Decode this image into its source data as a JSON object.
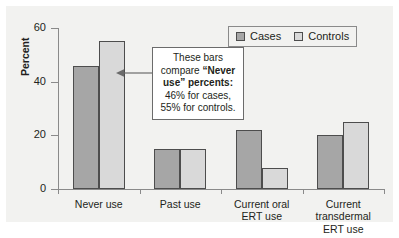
{
  "chart_data": {
    "type": "bar",
    "title": "",
    "xlabel": "",
    "ylabel": "Percent",
    "ylim": [
      0,
      60
    ],
    "yticks": [
      0,
      20,
      40,
      60
    ],
    "grid": false,
    "legend_position": "top-right",
    "categories": [
      "Never use",
      "Past use",
      "Current oral ERT use",
      "Current transdermal ERT use"
    ],
    "category_lines": [
      [
        "Never use"
      ],
      [
        "Past use"
      ],
      [
        "Current oral",
        "ERT use"
      ],
      [
        "Current",
        "transdermal",
        "ERT use"
      ]
    ],
    "series": [
      {
        "name": "Cases",
        "color": "#a6a6a6",
        "values": [
          46,
          15,
          22,
          20
        ]
      },
      {
        "name": "Controls",
        "color": "#d9d9d9",
        "values": [
          55,
          15,
          8,
          25
        ]
      }
    ],
    "annotations": [
      {
        "name": "never-use-callout",
        "text_parts": [
          {
            "text": "These bars compare ",
            "bold": false
          },
          {
            "text": "“Never use” percents:",
            "bold": true
          },
          {
            "text": " 46% for cases, 55% for controls.",
            "bold": false
          }
        ],
        "plain_text": "These bars compare “Never use” percents: 46% for cases, 55% for controls.",
        "points_to": "Never use controls bar"
      }
    ]
  },
  "legend": {
    "entries": [
      {
        "label": "Cases"
      },
      {
        "label": "Controls"
      }
    ]
  },
  "axis": {
    "y_title": "Percent",
    "y_tick_labels": [
      "60",
      "40",
      "20",
      "0"
    ]
  },
  "colors": {
    "cases": "#a6a6a6",
    "controls": "#d9d9d9",
    "bar_outline": "#4d4d4d",
    "axis": "#8a8a8a",
    "panel_background": "#f2f2f0",
    "text": "#231f20"
  }
}
